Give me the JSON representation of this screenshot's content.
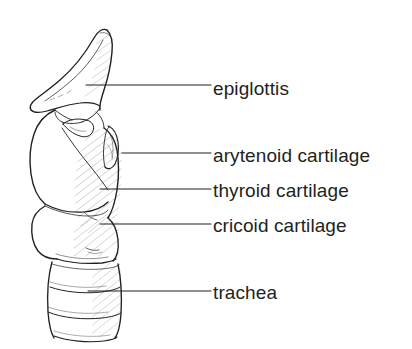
{
  "figure": {
    "background_color": "#ffffff",
    "ink_color": "#231f20",
    "style": "pen-and-ink line drawing with hatching"
  },
  "annotations": [
    {
      "id": "epiglottis",
      "label": "epiglottis",
      "label_x": 213,
      "label_y": 79,
      "leader": {
        "x1": 86,
        "y1": 85,
        "x2": 211,
        "y2": 85
      },
      "target": "epiglottis"
    },
    {
      "id": "arytenoid-cartilage",
      "label": "arytenoid cartilage",
      "label_x": 213,
      "label_y": 146,
      "leader": {
        "x1": 122,
        "y1": 153,
        "x2": 211,
        "y2": 153
      },
      "target": "arytenoid cartilage"
    },
    {
      "id": "thyroid-cartilage",
      "label": "thyroid cartilage",
      "label_x": 213,
      "label_y": 181,
      "leader": {
        "x1": 100,
        "y1": 189,
        "x2": 211,
        "y2": 189
      },
      "target": "thyroid cartilage"
    },
    {
      "id": "cricoid-cartilage",
      "label": "cricoid cartilage",
      "label_x": 213,
      "label_y": 216,
      "leader": {
        "x1": 100,
        "y1": 224,
        "x2": 211,
        "y2": 224
      },
      "target": "cricoid cartilage"
    },
    {
      "id": "trachea",
      "label": "trachea",
      "label_x": 213,
      "label_y": 283,
      "leader": {
        "x1": 88,
        "y1": 291,
        "x2": 211,
        "y2": 291
      },
      "target": "trachea"
    }
  ],
  "structures": {
    "epiglottis": {
      "name": "epiglottis",
      "description": "leaf-shaped cartilage flap curving superiorly and posteriorly above the laryngeal inlet"
    },
    "arytenoid_cartilage": {
      "name": "arytenoid cartilage",
      "description": "small paired cartilage at the posterior rim of the larynx"
    },
    "thyroid_cartilage": {
      "name": "thyroid cartilage",
      "description": "large shield-shaped cartilage forming the anterior wall of the larynx"
    },
    "cricoid_cartilage": {
      "name": "cricoid cartilage",
      "description": "ring-shaped cartilage inferior to the thyroid cartilage"
    },
    "trachea": {
      "name": "trachea",
      "description": "tube inferior to the cricoid cartilage showing three C-shaped cartilage rings",
      "visible_rings": 3
    }
  }
}
